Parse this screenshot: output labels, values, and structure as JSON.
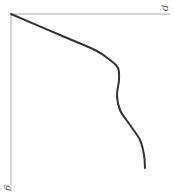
{
  "chart_data": {
    "type": "line",
    "title": "",
    "xlabel": "p",
    "ylabel": "g",
    "orientation": "rotated 90° clockwise",
    "grid": false,
    "legend": null,
    "series": [
      {
        "name": "curve",
        "color": "#333333",
        "points_px": [
          [
            11,
            14
          ],
          [
            60,
            35
          ],
          [
            95,
            50
          ],
          [
            110,
            60
          ],
          [
            118,
            68
          ],
          [
            119,
            80
          ],
          [
            117,
            95
          ],
          [
            120,
            110
          ],
          [
            130,
            125
          ],
          [
            140,
            140
          ],
          [
            144,
            155
          ],
          [
            145,
            168
          ]
        ]
      }
    ]
  },
  "axes": {
    "x_label": "p",
    "y_label": "g",
    "axis_color": "#aaaaaa",
    "line_color": "#333333"
  }
}
